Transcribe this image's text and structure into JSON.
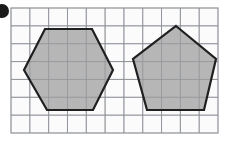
{
  "figure": {
    "canvas": {
      "width": 235,
      "height": 142,
      "background": "#ffffff"
    },
    "bullet_marker": {
      "name": "bullet-marker",
      "shape": "filled-circle",
      "cx": 2,
      "cy": 11,
      "r": 7,
      "color": "#1a1a1a"
    },
    "grid": {
      "x": 11,
      "y": 8,
      "width": 207,
      "height": 125,
      "columns": 11,
      "rows": 7,
      "cell_size": 18.8,
      "line_color": "#8c9096",
      "line_width": 0.9,
      "border_color": "#8c9096",
      "border_width": 1.2,
      "background": "#fbfbfb"
    },
    "shapes": [
      {
        "name": "hexagon",
        "label": "Hexagon",
        "sides": 6,
        "fill": "#a9a9a9",
        "fill_opacity": 0.85,
        "stroke": "#1f1f1f",
        "stroke_width": 2.2,
        "points": "45,29 92,29 113,70 93,110 47,110 24,70"
      },
      {
        "name": "pentagon",
        "label": "Pentagon",
        "sides": 5,
        "fill": "#a9a9a9",
        "fill_opacity": 0.85,
        "stroke": "#1f1f1f",
        "stroke_width": 2.2,
        "points": "176,26 216,59 204,110 147,110 133,59"
      }
    ]
  }
}
